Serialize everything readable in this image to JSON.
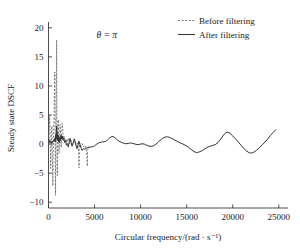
{
  "chart_data": {
    "type": "line",
    "title": "",
    "subtitle": "",
    "xlabel": "Circular frequency/(rad · s⁻¹)",
    "ylabel": "Steady state DSCF",
    "xlim": [
      0,
      26000
    ],
    "ylim": [
      -11,
      21
    ],
    "xticks": [
      0,
      5000,
      10000,
      15000,
      20000,
      25000
    ],
    "xtick_labels": [
      "0",
      "5000",
      "10000",
      "15000",
      "20000",
      "25000"
    ],
    "yticks": [
      -10,
      -5,
      0,
      5,
      10,
      15,
      20
    ],
    "ytick_labels": [
      "-10",
      "-5",
      "0",
      "5",
      "10",
      "15",
      "20"
    ],
    "grid": false,
    "legend_position": "top-right",
    "annotations": [
      {
        "text": "θ = π",
        "x": 5200,
        "y": 18.2
      }
    ],
    "series": [
      {
        "name": "Before filtering",
        "style": "dashed",
        "color": "#555555",
        "points": [
          [
            40,
            0.9
          ],
          [
            120,
            4.9
          ],
          [
            180,
            1.6
          ],
          [
            240,
            -4.2
          ],
          [
            300,
            0.4
          ],
          [
            360,
            3.1
          ],
          [
            420,
            -2.0
          ],
          [
            470,
            -7.2
          ],
          [
            520,
            -1.2
          ],
          [
            560,
            2.2
          ],
          [
            600,
            5.0
          ],
          [
            640,
            9.0
          ],
          [
            680,
            12.4
          ],
          [
            700,
            8.2
          ],
          [
            720,
            2.0
          ],
          [
            740,
            -3.0
          ],
          [
            760,
            -8.8
          ],
          [
            780,
            -4.0
          ],
          [
            800,
            1.0
          ],
          [
            830,
            5.4
          ],
          [
            860,
            12.2
          ],
          [
            880,
            17.9
          ],
          [
            900,
            11.0
          ],
          [
            920,
            3.4
          ],
          [
            940,
            -2.4
          ],
          [
            960,
            -5.4
          ],
          [
            990,
            -1.0
          ],
          [
            1020,
            2.6
          ],
          [
            1060,
            4.2
          ],
          [
            1100,
            1.2
          ],
          [
            1150,
            -1.6
          ],
          [
            1200,
            1.0
          ],
          [
            1260,
            3.4
          ],
          [
            1320,
            1.2
          ],
          [
            1380,
            -0.6
          ],
          [
            1440,
            2.4
          ],
          [
            1500,
            3.6
          ],
          [
            1560,
            2.2
          ],
          [
            1620,
            0.6
          ],
          [
            1700,
            1.4
          ],
          [
            1800,
            0.2
          ],
          [
            1900,
            0.9
          ],
          [
            2000,
            0.3
          ],
          [
            2150,
            1.0
          ],
          [
            2300,
            0.1
          ],
          [
            2450,
            0.6
          ],
          [
            2600,
            -0.1
          ],
          [
            2800,
            0.4
          ],
          [
            3000,
            -0.2
          ],
          [
            3150,
            0.2
          ],
          [
            3280,
            -1.2
          ],
          [
            3300,
            -3.0
          ],
          [
            3320,
            -4.1
          ],
          [
            3340,
            -1.0
          ],
          [
            3380,
            0.2
          ],
          [
            3500,
            -0.4
          ],
          [
            3650,
            0.1
          ],
          [
            3800,
            -0.5
          ],
          [
            3950,
            -0.2
          ],
          [
            4100,
            -0.8
          ],
          [
            4180,
            -2.2
          ],
          [
            4210,
            -3.8
          ],
          [
            4240,
            -1.4
          ],
          [
            4300,
            -0.5
          ],
          [
            4400,
            -0.6
          ],
          [
            4500,
            -0.55
          ]
        ]
      },
      {
        "name": "After filtering",
        "style": "solid",
        "color": "#333333",
        "points": [
          [
            40,
            0.8
          ],
          [
            150,
            0.2
          ],
          [
            260,
            0.5
          ],
          [
            380,
            0.1
          ],
          [
            500,
            0.6
          ],
          [
            600,
            0.4
          ],
          [
            680,
            1.0
          ],
          [
            740,
            0.4
          ],
          [
            790,
            1.6
          ],
          [
            830,
            0.9
          ],
          [
            860,
            2.2
          ],
          [
            890,
            3.1
          ],
          [
            920,
            1.7
          ],
          [
            950,
            0.6
          ],
          [
            985,
            1.9
          ],
          [
            1020,
            0.8
          ],
          [
            1060,
            1.5
          ],
          [
            1100,
            0.4
          ],
          [
            1150,
            1.1
          ],
          [
            1200,
            0.2
          ],
          [
            1260,
            1.3
          ],
          [
            1320,
            0.6
          ],
          [
            1380,
            1.5
          ],
          [
            1440,
            0.9
          ],
          [
            1500,
            1.4
          ],
          [
            1570,
            0.7
          ],
          [
            1650,
            1.0
          ],
          [
            1750,
            0.3
          ],
          [
            1850,
            0.6
          ],
          [
            1950,
            -0.2
          ],
          [
            2050,
            0.1
          ],
          [
            2150,
            -0.5
          ],
          [
            2250,
            0.4
          ],
          [
            2350,
            1.0
          ],
          [
            2450,
            0.3
          ],
          [
            2560,
            -0.4
          ],
          [
            2680,
            0.2
          ],
          [
            2800,
            0.9
          ],
          [
            2900,
            0.4
          ],
          [
            3000,
            -0.3
          ],
          [
            3100,
            -0.8
          ],
          [
            3200,
            -0.2
          ],
          [
            3300,
            0.5
          ],
          [
            3420,
            -0.1
          ],
          [
            3540,
            -0.7
          ],
          [
            3660,
            -1.1
          ],
          [
            3800,
            -0.8
          ],
          [
            3950,
            -0.9
          ],
          [
            4100,
            -0.7
          ],
          [
            4250,
            -0.6
          ],
          [
            4400,
            -0.55
          ],
          [
            4600,
            -0.5
          ],
          [
            4800,
            -0.45
          ],
          [
            5000,
            -0.3
          ],
          [
            5250,
            0.0
          ],
          [
            5500,
            0.25
          ],
          [
            5750,
            0.35
          ],
          [
            6000,
            0.4
          ],
          [
            6200,
            0.45
          ],
          [
            6400,
            0.7
          ],
          [
            6600,
            1.0
          ],
          [
            6800,
            1.25
          ],
          [
            7000,
            1.3
          ],
          [
            7200,
            1.1
          ],
          [
            7400,
            0.8
          ],
          [
            7650,
            0.5
          ],
          [
            7900,
            0.3
          ],
          [
            8150,
            0.15
          ],
          [
            8400,
            0.05
          ],
          [
            8650,
            0.1
          ],
          [
            8900,
            0.2
          ],
          [
            9150,
            0.1
          ],
          [
            9400,
            0.0
          ],
          [
            9650,
            -0.1
          ],
          [
            9900,
            -0.05
          ],
          [
            10150,
            0.05
          ],
          [
            10400,
            0.0
          ],
          [
            10650,
            -0.2
          ],
          [
            10900,
            -0.35
          ],
          [
            11150,
            -0.4
          ],
          [
            11400,
            -0.3
          ],
          [
            11650,
            -0.05
          ],
          [
            11900,
            0.3
          ],
          [
            12150,
            0.7
          ],
          [
            12400,
            1.0
          ],
          [
            12650,
            1.2
          ],
          [
            12900,
            1.25
          ],
          [
            13150,
            1.15
          ],
          [
            13400,
            0.95
          ],
          [
            13700,
            0.7
          ],
          [
            14000,
            0.45
          ],
          [
            14300,
            0.2
          ],
          [
            14600,
            0.0
          ],
          [
            14900,
            -0.25
          ],
          [
            15200,
            -0.55
          ],
          [
            15500,
            -0.95
          ],
          [
            15800,
            -1.3
          ],
          [
            16050,
            -1.45
          ],
          [
            16300,
            -1.4
          ],
          [
            16600,
            -1.2
          ],
          [
            16900,
            -0.9
          ],
          [
            17200,
            -0.6
          ],
          [
            17500,
            -0.4
          ],
          [
            17800,
            -0.25
          ],
          [
            18100,
            -0.1
          ],
          [
            18400,
            0.25
          ],
          [
            18700,
            0.85
          ],
          [
            19000,
            1.55
          ],
          [
            19250,
            1.95
          ],
          [
            19450,
            2.05
          ],
          [
            19700,
            1.85
          ],
          [
            20000,
            1.4
          ],
          [
            20300,
            0.9
          ],
          [
            20600,
            0.35
          ],
          [
            20900,
            -0.2
          ],
          [
            21200,
            -0.75
          ],
          [
            21500,
            -1.2
          ],
          [
            21800,
            -1.5
          ],
          [
            22050,
            -1.55
          ],
          [
            22300,
            -1.4
          ],
          [
            22600,
            -1.05
          ],
          [
            22900,
            -0.6
          ],
          [
            23200,
            -0.15
          ],
          [
            23500,
            0.35
          ],
          [
            23800,
            0.9
          ],
          [
            24100,
            1.5
          ],
          [
            24400,
            2.0
          ],
          [
            24650,
            2.45
          ]
        ]
      }
    ]
  },
  "legend": {
    "items": [
      {
        "label": "Before filtering",
        "style": "dashed"
      },
      {
        "label": "After filtering",
        "style": "solid"
      }
    ]
  },
  "axes": {
    "x_title": "Circular frequency/(rad · s⁻¹)",
    "y_title": "Steady state DSCF"
  }
}
